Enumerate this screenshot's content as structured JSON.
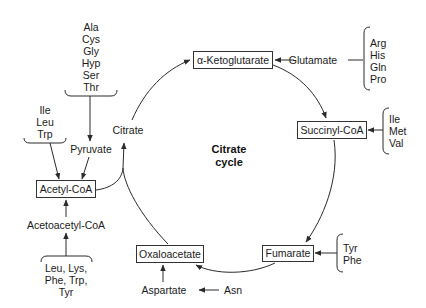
{
  "diagram": {
    "title": "Citrate cycle",
    "center_label": {
      "line1": "Citrate",
      "line2": "cycle"
    },
    "nodes": {
      "alpha_ketoglutarate": "α-Ketoglutarate",
      "succinyl_coa": "Succinyl-CoA",
      "fumarate": "Fumarate",
      "oxaloacetate": "Oxaloacetate",
      "acetyl_coa": "Acetyl-CoA",
      "citrate": "Citrate",
      "pyruvate": "Pyruvate",
      "acetoacetyl_coa": "Acetoacetyl-CoA",
      "glutamate": "Glutamate",
      "aspartate": "Aspartate",
      "asn": "Asn"
    },
    "amino_acid_groups": {
      "to_pyruvate": [
        "Ala",
        "Cys",
        "Gly",
        "Hyp",
        "Ser",
        "Thr"
      ],
      "to_acetyl_coa": [
        "Ile",
        "Leu",
        "Trp"
      ],
      "to_acetoacetyl_coa": [
        "Leu, Lys,",
        "Phe, Trp,",
        "Tyr"
      ],
      "to_glutamate": [
        "Arg",
        "His",
        "Gln",
        "Pro"
      ],
      "to_succinyl_coa": [
        "Ile",
        "Met",
        "Val"
      ],
      "to_fumarate": [
        "Tyr",
        "Phe"
      ]
    },
    "colors": {
      "line": "#2a2a2a",
      "text": "#1a1a1a",
      "background": "#ffffff"
    }
  }
}
